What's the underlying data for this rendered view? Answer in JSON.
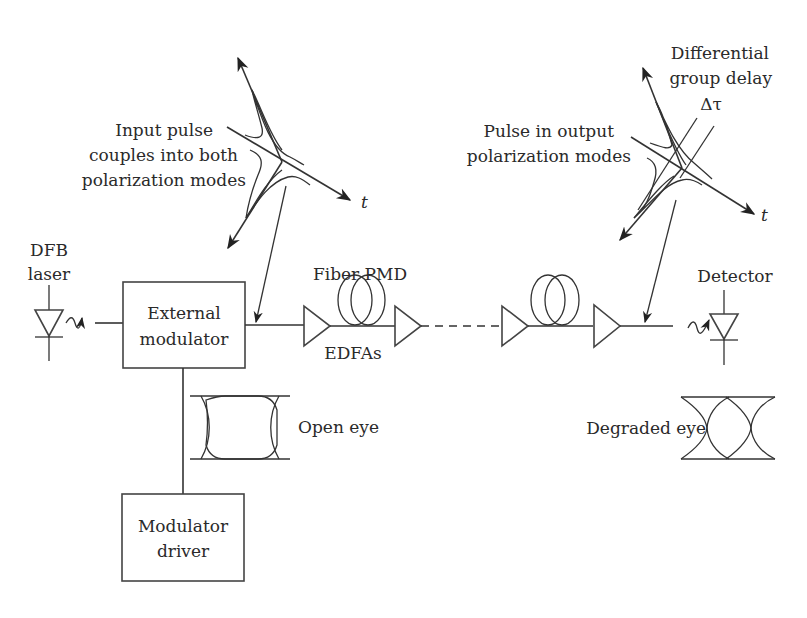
{
  "diagram": {
    "labels": {
      "dfb_laser_line1": "DFB",
      "dfb_laser_line2": "laser",
      "ext_mod_line1": "External",
      "ext_mod_line2": "modulator",
      "mod_driver_line1": "Modulator",
      "mod_driver_line2": "driver",
      "fiber_pmd": "Fiber PMD",
      "edfas": "EDFAs",
      "detector": "Detector",
      "open_eye": "Open eye",
      "degraded_eye": "Degraded eye",
      "input_pulse_line1": "Input pulse",
      "input_pulse_line2": "couples into both",
      "input_pulse_line3": "polarization modes",
      "output_pulse_line1": "Pulse in output",
      "output_pulse_line2": "polarization modes",
      "dgd_line1": "Differential",
      "dgd_line2": "group delay",
      "dgd_symbol": "Δτ",
      "time_axis_left": "t",
      "time_axis_right": "t"
    },
    "components": [
      {
        "id": "dfb-laser",
        "type": "laser-diode"
      },
      {
        "id": "external-modulator",
        "type": "box"
      },
      {
        "id": "modulator-driver",
        "type": "box"
      },
      {
        "id": "edfa-1",
        "type": "amplifier"
      },
      {
        "id": "fiber-coil-1",
        "type": "fiber-spool"
      },
      {
        "id": "edfa-2",
        "type": "amplifier"
      },
      {
        "id": "edfa-3",
        "type": "amplifier"
      },
      {
        "id": "fiber-coil-2",
        "type": "fiber-spool"
      },
      {
        "id": "edfa-4",
        "type": "amplifier"
      },
      {
        "id": "detector",
        "type": "photodiode"
      }
    ],
    "colors": {
      "line": "#333333",
      "text": "#2a2a2a",
      "background": "#ffffff"
    }
  }
}
